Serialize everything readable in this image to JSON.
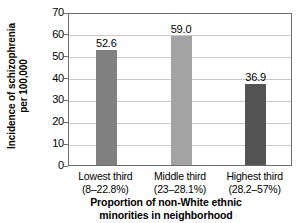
{
  "chart_data": {
    "type": "bar",
    "title": "",
    "categories": [
      "Lowest third",
      "Middle third",
      "Highest third"
    ],
    "category_ranges": [
      "(8–22.8%)",
      "(23–28.1%)",
      "(28.2–57%)"
    ],
    "values": [
      52.6,
      59.0,
      36.9
    ],
    "value_labels": [
      "52.6",
      "59.0",
      "36.9"
    ],
    "bar_colors": [
      "#808080",
      "#a3a3a3",
      "#545454"
    ],
    "xlabel_line1": "Proportion of non-White ethnic",
    "xlabel_line2": "minorities in neighborhood",
    "ylabel_line1": "Incidence of schizophrenia",
    "ylabel_line2": "per 100,000",
    "ylim": [
      0,
      70
    ],
    "ytick_values": [
      0,
      10,
      20,
      30,
      40,
      50,
      60,
      70
    ],
    "ytick_labels": [
      "0",
      "10",
      "20",
      "30",
      "40",
      "50",
      "60",
      "70"
    ],
    "grid": true,
    "legend": "none",
    "axis_color": "#6e6e6e",
    "grid_color": "#c9c9c9",
    "background": "#ffffff"
  }
}
